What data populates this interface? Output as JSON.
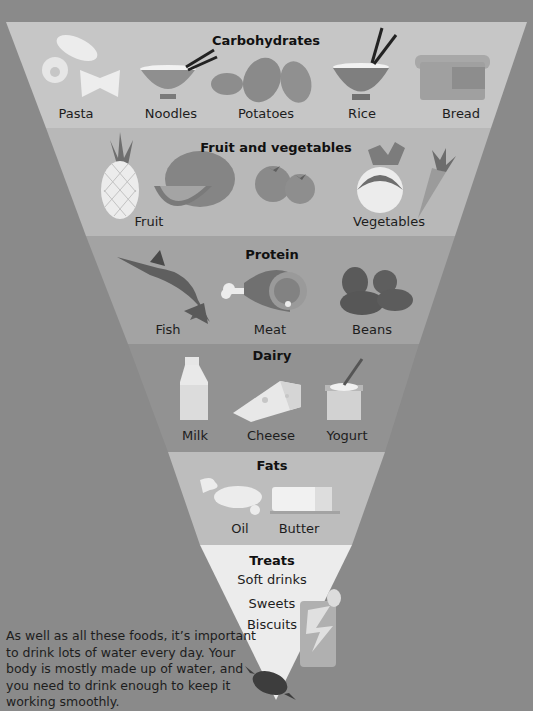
{
  "colors": {
    "background": "#8a8a8a",
    "band_carbohydrates": "#c6c6c6",
    "band_fruit_vegetables": "#b8b8b8",
    "band_protein": "#a3a3a3",
    "band_dairy": "#929292",
    "band_fats": "#bdbdbd",
    "band_treats": "#ececec",
    "text": "#1d1d1d"
  },
  "pyramid": {
    "carbohydrates": {
      "title": "Carbohydrates",
      "items": [
        "Pasta",
        "Noodles",
        "Potatoes",
        "Rice",
        "Bread"
      ]
    },
    "fruit_vegetables": {
      "title": "Fruit and vegetables",
      "items": [
        "Fruit",
        "Vegetables"
      ]
    },
    "protein": {
      "title": "Protein",
      "items": [
        "Fish",
        "Meat",
        "Beans"
      ]
    },
    "dairy": {
      "title": "Dairy",
      "items": [
        "Milk",
        "Cheese",
        "Yogurt"
      ]
    },
    "fats": {
      "title": "Fats",
      "items": [
        "Oil",
        "Butter"
      ]
    },
    "treats": {
      "title": "Treats",
      "items": [
        "Soft drinks",
        "Sweets",
        "Biscuits"
      ]
    }
  },
  "icons": [
    "pasta-icon",
    "noodle-bowl-icon",
    "potatoes-icon",
    "rice-bowl-icon",
    "bread-icon",
    "pineapple-icon",
    "watermelon-icon",
    "tomatoes-icon",
    "turnip-icon",
    "carrot-icon",
    "swordfish-icon",
    "ham-icon",
    "beans-icon",
    "milk-bottle-icon",
    "cheese-icon",
    "yogurt-icon",
    "oil-splash-icon",
    "butter-icon",
    "soda-can-icon",
    "sweet-candy-icon"
  ],
  "note": "As well as all these foods, it’s important to drink lots of water every day. Your body is mostly made up of water, and you need to drink enough to keep it working smoothly."
}
